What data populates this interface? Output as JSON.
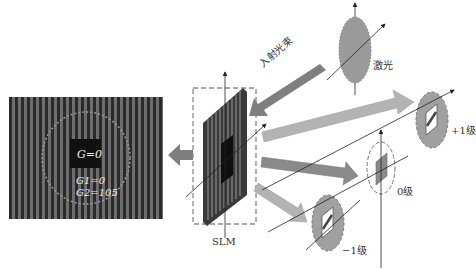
{
  "diagram": {
    "colors": {
      "arrow_dark": "#7f7f7f",
      "arrow_light": "#b3b3b3",
      "ellipse_fill": "#9a9a9a",
      "panel_bg": "#2a2a2a",
      "panel_stripe": "#6e6e6e",
      "center_square": "#111111",
      "dashed": "#8a8a8a"
    },
    "left_panel": {
      "center_label": "G=0",
      "g1_label": "G1=0",
      "g2_label": "G2=105"
    },
    "slm": {
      "label": "SLM"
    },
    "incident": {
      "label": "入射光束"
    },
    "laser": {
      "label": "激光"
    },
    "orders": [
      {
        "id": "plus1",
        "label": "+1级"
      },
      {
        "id": "zero",
        "label": "0级"
      },
      {
        "id": "minus1",
        "label": "−1级"
      }
    ]
  }
}
